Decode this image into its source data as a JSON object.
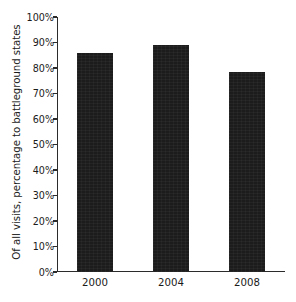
{
  "chart_data": {
    "type": "bar",
    "title": "",
    "subtitle": "",
    "xlabel": "",
    "ylabel": "Of all visits, percentage to battleground states",
    "categories": [
      "2000",
      "2004",
      "2008"
    ],
    "values": [
      86,
      89,
      78.5
    ],
    "series": [
      {
        "name": "Of all visits, percentage to battleground states",
        "values": [
          86,
          89,
          78.5
        ]
      }
    ],
    "ylim": [
      0,
      100
    ],
    "ytick_values": [
      0,
      10,
      20,
      30,
      40,
      50,
      60,
      70,
      80,
      90,
      100
    ],
    "ytick_labels": [
      "0%",
      "10%",
      "20%",
      "30%",
      "40%",
      "50%",
      "60%",
      "70%",
      "80%",
      "90%",
      "100%"
    ],
    "grid": false,
    "legend": false,
    "legend_position": "none",
    "bar_color": "#1c1c1c",
    "axis_color": "#2b2b2b",
    "background_color": "#ffffff",
    "text_color": "#1b1b1b",
    "annotations": []
  }
}
